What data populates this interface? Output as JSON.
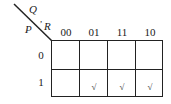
{
  "kmap": {
    "row_variable": "P",
    "column_variables": "Q, R",
    "column_var_q": "Q",
    "column_var_sep": ",",
    "column_var_r": "R",
    "column_headers": [
      "00",
      "01",
      "11",
      "10"
    ],
    "row_headers": [
      "0",
      "1"
    ],
    "mark_symbol": "√",
    "cells": [
      [
        "",
        "",
        "",
        ""
      ],
      [
        "",
        "√",
        "√",
        "√"
      ]
    ]
  }
}
